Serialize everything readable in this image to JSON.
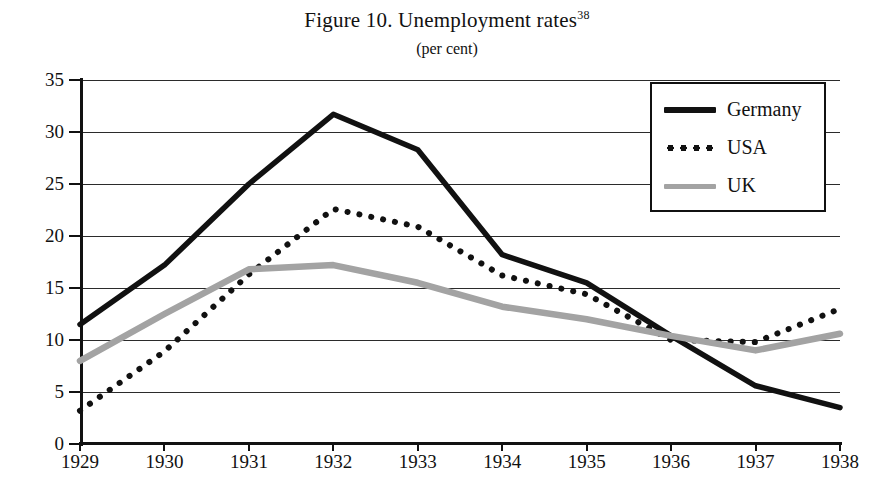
{
  "figure": {
    "title": "Figure 10. Unemployment rates",
    "title_superscript": "38",
    "subtitle": "(per cent)"
  },
  "legend": {
    "position": "top-right-inside",
    "entries": [
      {
        "label": "Germany",
        "style": "solid",
        "color": "#111111",
        "swatch": "solid-black-swatch"
      },
      {
        "label": "USA",
        "style": "dotted",
        "color": "#111111",
        "swatch": "dotted-black-swatch"
      },
      {
        "label": "UK",
        "style": "solid",
        "color": "#a3a3a3",
        "swatch": "solid-gray-swatch"
      }
    ]
  },
  "axes": {
    "y_ticks": [
      "0",
      "5",
      "10",
      "15",
      "20",
      "25",
      "30",
      "35"
    ],
    "x_ticks": [
      "1929",
      "1930",
      "1931",
      "1932",
      "1933",
      "1934",
      "1935",
      "1936",
      "1937",
      "1938"
    ]
  },
  "chart_data": {
    "type": "line",
    "title": "Figure 10. Unemployment rates",
    "subtitle": "(per cent)",
    "xlabel": "",
    "ylabel": "",
    "ylim": [
      0,
      35
    ],
    "ytick_step": 5,
    "grid": true,
    "legend_position": "top-right",
    "categories": [
      "1929",
      "1930",
      "1931",
      "1932",
      "1933",
      "1934",
      "1935",
      "1936",
      "1937",
      "1938"
    ],
    "series": [
      {
        "name": "Germany",
        "color": "#111111",
        "style": "solid",
        "values": [
          11.5,
          17.2,
          25.0,
          31.7,
          28.3,
          18.2,
          15.5,
          10.4,
          5.6,
          3.5
        ]
      },
      {
        "name": "USA",
        "color": "#111111",
        "style": "dotted",
        "values": [
          3.2,
          8.9,
          16.3,
          22.6,
          20.9,
          16.2,
          14.4,
          10.0,
          9.8,
          13.0
        ]
      },
      {
        "name": "UK",
        "color": "#a3a3a3",
        "style": "solid",
        "values": [
          8.0,
          12.5,
          16.8,
          17.2,
          15.5,
          13.2,
          12.0,
          10.4,
          9.0,
          10.6
        ]
      }
    ]
  }
}
